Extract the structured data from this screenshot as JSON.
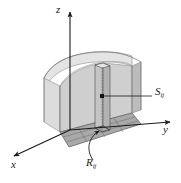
{
  "figure": {
    "name": "double-integral-riemann-sum-diagram",
    "background": "#ffffff",
    "ink_color": "#1a1a1a"
  },
  "axes": {
    "z": {
      "label": "z",
      "direction": "up"
    },
    "y": {
      "label": "y",
      "direction": "right"
    },
    "x": {
      "label": "x",
      "direction": "down-left"
    }
  },
  "annotations": {
    "surface_point": {
      "base": "S",
      "subscript": "ij",
      "leader": "horizontal-line-to-dot"
    },
    "base_rectangle": {
      "base": "R",
      "subscript": "ij",
      "leader": "curved-arrow-to-patch"
    }
  },
  "shading": {
    "solid_front_face": "#c9c9c9",
    "solid_left_face": "#d8d8d8",
    "solid_top_surface": "#e0e0e0",
    "base_grid_fill": "#a8a8a8",
    "column_fill": "#bdbdbd",
    "grid_line": "#6a6a6a"
  }
}
